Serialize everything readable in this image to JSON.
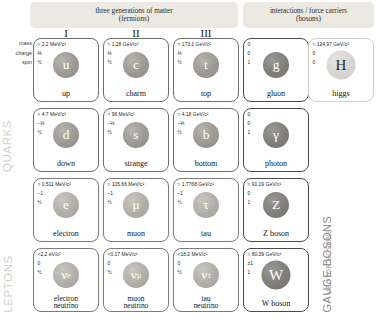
{
  "headers": {
    "fermions_line1": "three generations of matter",
    "fermions_line2": "(fermions)",
    "bosons_line1": "interactions / force carriers",
    "bosons_line2": "(bosons)"
  },
  "generations": {
    "g1": "I",
    "g2": "II",
    "g3": "III"
  },
  "property_labels": {
    "mass": "mass",
    "charge": "charge",
    "spin": "spin"
  },
  "group_labels": {
    "quarks": "QUARKS",
    "leptons": "LEPTONS",
    "gauge_bosons": "GAUGE BOSONS",
    "vector_bosons": "VECTOR BOSONS",
    "scalar_bosons": "SCALAR BOSONS"
  },
  "particles": {
    "up": {
      "mass": "≈ 2.2 MeV/c²",
      "charge": "⅔",
      "spin": "½",
      "symbol": "u",
      "name": "up"
    },
    "charm": {
      "mass": "≈ 1.28 GeV/c²",
      "charge": "⅔",
      "spin": "½",
      "symbol": "c",
      "name": "charm"
    },
    "top": {
      "mass": "≈ 173.1 GeV/c²",
      "charge": "⅔",
      "spin": "½",
      "symbol": "t",
      "name": "top"
    },
    "gluon": {
      "mass": "0",
      "charge": "0",
      "spin": "1",
      "symbol": "g",
      "name": "gluon"
    },
    "higgs": {
      "mass": "≈ 124.97 GeV/c²",
      "charge": "0",
      "spin": "0",
      "symbol": "H",
      "name": "higgs"
    },
    "down": {
      "mass": "≈ 4.7 MeV/c²",
      "charge": "−⅓",
      "spin": "½",
      "symbol": "d",
      "name": "down"
    },
    "strange": {
      "mass": "≈ 96 MeV/c²",
      "charge": "−⅓",
      "spin": "½",
      "symbol": "s",
      "name": "strange"
    },
    "bottom": {
      "mass": "≈ 4.18 GeV/c²",
      "charge": "−⅓",
      "spin": "½",
      "symbol": "b",
      "name": "bottom"
    },
    "photon": {
      "mass": "0",
      "charge": "0",
      "spin": "1",
      "symbol": "γ",
      "name": "photon"
    },
    "electron": {
      "mass": "≈ 0.511 MeV/c²",
      "charge": "−1",
      "spin": "½",
      "symbol": "e",
      "name": "electron"
    },
    "muon": {
      "mass": "≈ 105.66 MeV/c²",
      "charge": "−1",
      "spin": "½",
      "symbol": "μ",
      "name": "muon"
    },
    "tau": {
      "mass": "≈ 1.7768 GeV/c²",
      "charge": "−1",
      "spin": "½",
      "symbol": "τ",
      "name": "tau"
    },
    "zboson": {
      "mass": "≈ 91.19 GeV/c²",
      "charge": "0",
      "spin": "1",
      "symbol": "Z",
      "name": "Z boson"
    },
    "enu": {
      "mass": "<2.2 eV/c²",
      "charge": "0",
      "spin": "½",
      "symbol": "ν",
      "sub": "e",
      "name_l1": "electron",
      "name_l2": "neutrino"
    },
    "munu": {
      "mass": "<0.17 MeV/c²",
      "charge": "0",
      "spin": "½",
      "symbol": "ν",
      "sub": "μ",
      "name_l1": "muon",
      "name_l2": "neutrino"
    },
    "taunu": {
      "mass": "<18.2 MeV/c²",
      "charge": "0",
      "spin": "½",
      "symbol": "ν",
      "sub": "τ",
      "name_l1": "tau",
      "name_l2": "neutrino"
    },
    "wboson": {
      "mass": "≈ 80.39 GeV/c²",
      "charge": "±1",
      "spin": "1",
      "symbol": "W",
      "name": "W boson"
    }
  }
}
